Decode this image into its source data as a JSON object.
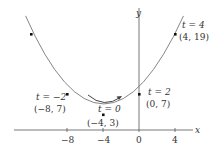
{
  "axes": {
    "x_label": "x",
    "y_label": "y",
    "x_ticks": [
      {
        "value": -8,
        "label": "−8"
      },
      {
        "value": -4,
        "label": "−4"
      },
      {
        "value": 0,
        "label": "0"
      },
      {
        "value": 4,
        "label": "4"
      }
    ]
  },
  "curve": {
    "description": "parametric parabola x = 2t - 4, y = t^2 + 3",
    "color": "#777777"
  },
  "points": [
    {
      "t": -4,
      "x": -12,
      "y": 19,
      "t_label": "",
      "coord_label": ""
    },
    {
      "t": -2,
      "x": -8,
      "y": 7,
      "t_label": "t = −2",
      "coord_label": "(−8, 7)"
    },
    {
      "t": 0,
      "x": -4,
      "y": 3,
      "t_label": "t = 0",
      "coord_label": "(−4, 3)"
    },
    {
      "t": 2,
      "x": 0,
      "y": 7,
      "t_label": "t = 2",
      "coord_label": "(0, 7)"
    },
    {
      "t": 4,
      "x": 4,
      "y": 19,
      "t_label": "t = 4",
      "coord_label": "(4, 19)"
    }
  ],
  "labels": {
    "p_m2_t": "t = −2",
    "p_m2_c": "(−8, 7)",
    "p_0_t": "t = 0",
    "p_0_c": "(−4, 3)",
    "p_2_t": "t = 2",
    "p_2_c": "(0, 7)",
    "p_4_t": "t = 4",
    "p_4_c": "(4, 19)",
    "x_axis": "x",
    "y_axis": "y",
    "tick_m8": "−8",
    "tick_m4": "−4",
    "tick_0": "0",
    "tick_4": "4"
  },
  "direction_arrow": "increasing t, left to right"
}
